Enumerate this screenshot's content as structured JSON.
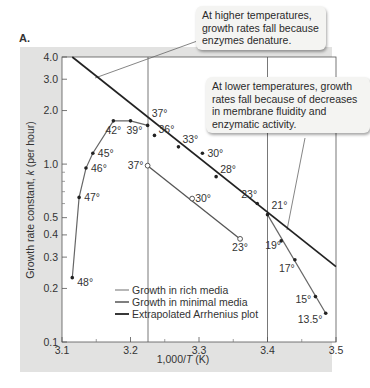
{
  "panel_label": "A.",
  "callouts": {
    "high": "At higher temperatures, growth rates fall because enzymes denature.",
    "low": "At lower temperatures, growth rates fall because of decreases in membrane fluidity and enzymatic activity."
  },
  "chart_data": {
    "type": "line",
    "title": "",
    "xlabel": "1,000/T (K)",
    "ylabel": "Growth rate constant, k (per hour)",
    "xlim": [
      3.1,
      3.5
    ],
    "ylim": [
      0.1,
      4.0
    ],
    "yscale": "log",
    "x_ticks": [
      "3.1",
      "3.2",
      "3.3",
      "3.4",
      "3.5"
    ],
    "y_ticks": [
      "0.1",
      "0.2",
      "0.3",
      "0.4",
      "0.5",
      "1.0",
      "2.0",
      "3.0",
      "4.0"
    ],
    "grid": false,
    "legend_position": "lower center",
    "legend": [
      "Growth in rich media",
      "Growth in minimal media",
      "Extrapolated Arrhenius plot"
    ],
    "reference_lines_x": [
      3.23,
      3.4
    ],
    "series": [
      {
        "name": "Growth in rich media",
        "marker": "filled",
        "points": [
          {
            "label": "48°",
            "x": 3.115,
            "y": 0.23
          },
          {
            "label": "47°",
            "x": 3.125,
            "y": 0.65
          },
          {
            "label": "46°",
            "x": 3.135,
            "y": 0.95
          },
          {
            "label": "45°",
            "x": 3.145,
            "y": 1.15
          },
          {
            "label": "42°",
            "x": 3.175,
            "y": 1.75
          },
          {
            "label": "39°",
            "x": 3.2,
            "y": 1.75
          },
          {
            "label": "37°",
            "x": 3.225,
            "y": 1.65
          },
          {
            "label": "36°",
            "x": 3.235,
            "y": 1.45
          },
          {
            "label": "33°",
            "x": 3.27,
            "y": 1.25
          },
          {
            "label": "30°",
            "x": 3.305,
            "y": 1.15
          },
          {
            "label": "28°",
            "x": 3.325,
            "y": 0.85
          },
          {
            "label": "23°",
            "x": 3.385,
            "y": 0.6
          },
          {
            "label": "21°",
            "x": 3.4,
            "y": 0.52
          },
          {
            "label": "19°",
            "x": 3.42,
            "y": 0.37
          },
          {
            "label": "17°",
            "x": 3.44,
            "y": 0.29
          },
          {
            "label": "15°",
            "x": 3.47,
            "y": 0.18
          },
          {
            "label": "13.5°",
            "x": 3.485,
            "y": 0.145
          }
        ]
      },
      {
        "name": "Growth in minimal media",
        "marker": "open",
        "points": [
          {
            "label": "37°",
            "x": 3.225,
            "y": 0.98
          },
          {
            "label": "30°",
            "x": 3.29,
            "y": 0.64
          },
          {
            "label": "23°",
            "x": 3.36,
            "y": 0.38
          }
        ]
      },
      {
        "name": "Extrapolated Arrhenius plot",
        "marker": "none",
        "points": [
          {
            "x": 3.115,
            "y": 4.0
          },
          {
            "x": 3.5,
            "y": 0.265
          }
        ]
      }
    ]
  }
}
